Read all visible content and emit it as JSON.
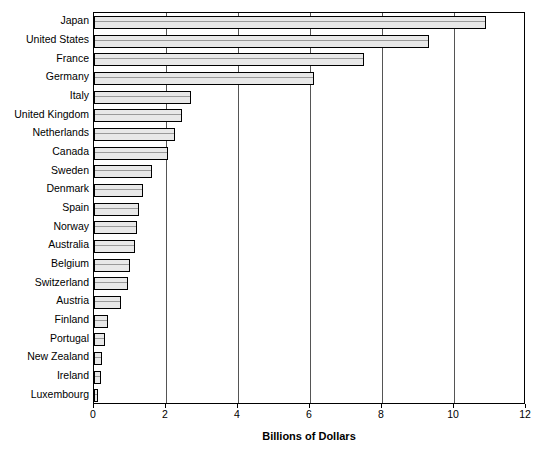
{
  "chart_data": {
    "type": "bar",
    "orientation": "horizontal",
    "title": "",
    "xlabel": "Billions of Dollars",
    "ylabel": "",
    "xlim": [
      0,
      12
    ],
    "xticks": [
      0,
      2,
      4,
      6,
      8,
      10,
      12
    ],
    "xtick_labels": [
      "0",
      "2",
      "4",
      "6",
      "8",
      "10",
      "12"
    ],
    "grid": "vertical",
    "legend": "none",
    "categories": [
      "Japan",
      "United States",
      "France",
      "Germany",
      "Italy",
      "United Kingdom",
      "Netherlands",
      "Canada",
      "Sweden",
      "Denmark",
      "Spain",
      "Norway",
      "Australia",
      "Belgium",
      "Switzerland",
      "Austria",
      "Finland",
      "Portugal",
      "New Zealand",
      "Ireland",
      "Luxembourg"
    ],
    "values": [
      10.9,
      9.3,
      7.5,
      6.1,
      2.7,
      2.45,
      2.25,
      2.05,
      1.6,
      1.35,
      1.25,
      1.2,
      1.15,
      1.0,
      0.95,
      0.75,
      0.4,
      0.3,
      0.23,
      0.2,
      0.1
    ],
    "bar_fill_color": "#e8e8e8",
    "bar_edge_color": "#000000",
    "gridline_color": "#555555"
  }
}
